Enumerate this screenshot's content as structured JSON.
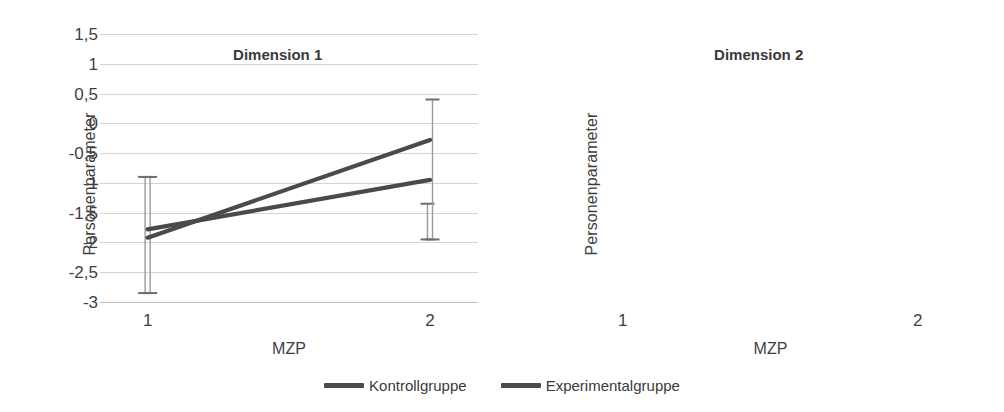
{
  "chart_data": [
    {
      "type": "line",
      "title": "Dimension 1",
      "xlabel": "MZP",
      "ylabel": "Personenparameter",
      "x": [
        1,
        2
      ],
      "xticklabels": [
        "1",
        "2"
      ],
      "yticklabels": [
        "1,5",
        "1",
        "0,5",
        "0",
        "-0,5",
        "-1",
        "-1,5",
        "-2",
        "-2,5",
        "-3"
      ],
      "ytickvalues": [
        1.5,
        1,
        0.5,
        0,
        -0.5,
        -1,
        -1.5,
        -2,
        -2.5,
        -3
      ],
      "ylim": [
        -3,
        1.5
      ],
      "grid": true,
      "legend_position": "bottom-center-figure",
      "series": [
        {
          "name": "Kontrollgruppe",
          "values": [
            -1.78,
            -0.95
          ],
          "error_upper": [
            -0.9,
            -1.35
          ],
          "error_lower": [
            -2.85,
            -1.95
          ],
          "color": "#4a4a4a"
        },
        {
          "name": "Experimentalgruppe",
          "values": [
            -1.92,
            -0.28
          ],
          "error_upper": [
            -0.9,
            0.4
          ],
          "error_lower": [
            -2.85,
            -1.95
          ],
          "color": "#4a4a4a"
        }
      ]
    },
    {
      "type": "line",
      "title": "Dimension 2",
      "xlabel": "MZP",
      "ylabel": "Personenparameter",
      "x": [
        1,
        2
      ],
      "xticklabels": [
        "1",
        "2"
      ],
      "yticklabels": [
        "1,5",
        "1",
        "0,5",
        "0",
        "-0,5",
        "-1",
        "-1,5",
        "-2",
        "-2,5",
        "-3"
      ],
      "ytickvalues": [
        1.5,
        1,
        0.5,
        0,
        -0.5,
        -1,
        -1.5,
        -2,
        -2.5,
        -3
      ],
      "ylim": [
        -3,
        1.5
      ],
      "grid": true,
      "legend_position": "bottom-center-figure",
      "series": [
        {
          "name": "Kontrollgruppe",
          "values": [
            -1.22,
            0.1
          ],
          "error_upper": [
            -0.45,
            1.05
          ],
          "error_lower": [
            -2.28,
            -0.95
          ],
          "color": "#4a4a4a"
        },
        {
          "name": "Experimentalgruppe",
          "values": [
            -1.45,
            0.0
          ],
          "error_upper": [
            -0.45,
            1.05
          ],
          "error_lower": [
            -2.42,
            -0.95
          ],
          "color": "#4a4a4a"
        }
      ]
    }
  ],
  "legend": {
    "items": [
      {
        "label": "Kontrollgruppe",
        "color": "#4a4a4a"
      },
      {
        "label": "Experimentalgruppe",
        "color": "#4a4a4a"
      }
    ]
  },
  "colors": {
    "line": "#4a4a4a",
    "grid": "#d4d4d4",
    "errorbar": "#9a9a9a",
    "text": "#3f3f3f",
    "background": "#ffffff"
  }
}
